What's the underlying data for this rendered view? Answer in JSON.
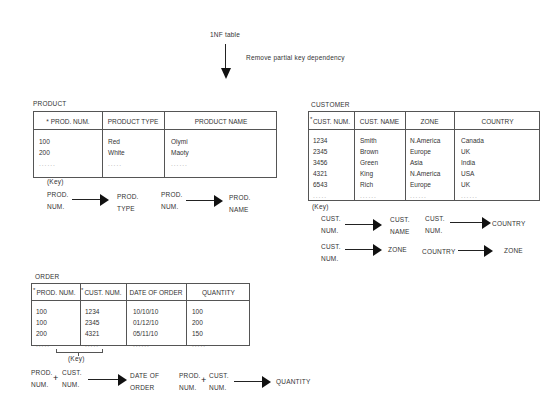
{
  "header": {
    "title": "1NF table",
    "transform_label": "Remove partial key dependency"
  },
  "product": {
    "label": "PRODUCT",
    "key_marker": "*",
    "columns": [
      "PROD.  NUM.",
      "PRODUCT TYPE",
      "PRODUCT NAME"
    ],
    "rows": [
      [
        "100",
        "Red",
        "Olymi"
      ],
      [
        "200",
        "White",
        "Maoty"
      ],
      [
        "......",
        ".....",
        "......"
      ]
    ],
    "key_label": "(Key)",
    "dependencies": [
      {
        "from_line1": "PROD.",
        "from_line2": "NUM.",
        "to_line1": "PROD.",
        "to_line2": "TYPE"
      },
      {
        "from_line1": "PROD.",
        "from_line2": "NUM.",
        "to_line1": "PROD.",
        "to_line2": "NAME"
      }
    ]
  },
  "customer": {
    "label": "CUSTOMER",
    "key_marker": "*",
    "columns": [
      "CUST.  NUM.",
      "CUST.  NAME",
      "ZONE",
      "COUNTRY"
    ],
    "rows": [
      [
        "1234",
        "Smith",
        "N.America",
        "Canada"
      ],
      [
        "2345",
        "Brown",
        "Europe",
        "UK"
      ],
      [
        "3456",
        "Green",
        "Asia",
        "India"
      ],
      [
        "4321",
        "King",
        "N.America",
        "USA"
      ],
      [
        "6543",
        "Rich",
        "Europe",
        "UK"
      ],
      [
        ".....",
        "......",
        "......",
        "......"
      ]
    ],
    "key_label": "(Key)",
    "dependencies": [
      {
        "from_line1": "CUST.",
        "from_line2": "NUM.",
        "to_line1": "CUST.",
        "to_line2": "NAME"
      },
      {
        "from_line1": "CUST.",
        "from_line2": "NUM.",
        "to_line1": "COUNTRY",
        "to_line2": ""
      },
      {
        "from_line1": "CUST.",
        "from_line2": "NUM.",
        "to_line1": "ZONE",
        "to_line2": ""
      },
      {
        "from_line1": "COUNTRY",
        "from_line2": "",
        "to_line1": "ZONE",
        "to_line2": ""
      }
    ]
  },
  "order": {
    "label": "ORDER",
    "key_marker": "*",
    "columns": [
      "PROD.  NUM.",
      "CUST.  NUM.",
      "DATE OF ORDER",
      "QUANTITY"
    ],
    "rows": [
      [
        "100",
        "1234",
        "10/10/10",
        "100"
      ],
      [
        "100",
        "2345",
        "01/12/10",
        "200"
      ],
      [
        "200",
        "4321",
        "05/11/10",
        "150"
      ],
      [
        ".....",
        ".....",
        "......",
        "....."
      ]
    ],
    "key_label": "(Key)",
    "plus": "+",
    "dependencies": [
      {
        "a_line1": "PROD.",
        "a_line2": "NUM.",
        "b_line1": "CUST.",
        "b_line2": "NUM.",
        "to_line1": "DATE OF",
        "to_line2": "ORDER"
      },
      {
        "a_line1": "PROD.",
        "a_line2": "NUM.",
        "b_line1": "CUST.",
        "b_line2": "NUM.",
        "to_line1": "QUANTITY",
        "to_line2": ""
      }
    ]
  }
}
